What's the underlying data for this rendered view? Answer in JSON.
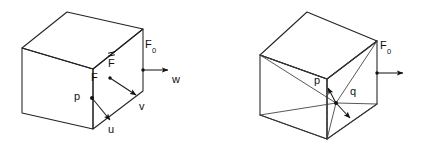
{
  "figure": {
    "background_color": "#ffffff",
    "line_color": "#222222",
    "text_color": "#111111",
    "width": 422,
    "height": 145
  },
  "left_cube": {
    "name": "undeformed-cube",
    "labels": {
      "F0": "F",
      "F0_sub": "0",
      "F_plain": "F",
      "F_tensor": "F",
      "p": "p",
      "u": "u",
      "v": "v",
      "w": "w"
    }
  },
  "right_cube": {
    "name": "triangulated-cube",
    "labels": {
      "F0": "F",
      "F0_sub": "0",
      "p": "p",
      "q": "q"
    }
  }
}
